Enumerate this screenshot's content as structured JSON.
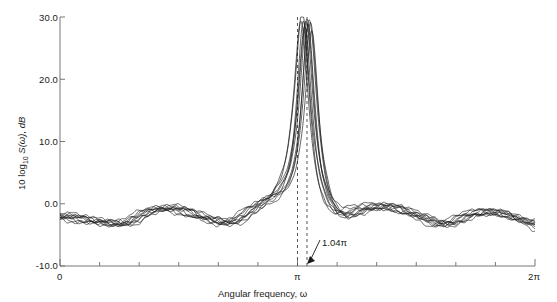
{
  "chart_data": {
    "type": "line",
    "title": "",
    "subtitle": "",
    "xlabel": "Angular frequency, ω",
    "ylabel": "10 log₁₀ S(ω), dB",
    "xlim": [
      0,
      6.283185307
    ],
    "ylim": [
      -10.0,
      30.0
    ],
    "grid": false,
    "legend": null,
    "x_tick_labels": [
      "0",
      "π",
      "2π"
    ],
    "x_tick_values": [
      0,
      3.14159265,
      6.28318531
    ],
    "x_minor_tick_count": 12,
    "y_tick_labels": [
      "30.0",
      "20.0",
      "10.0",
      "0.0",
      "-10.0"
    ],
    "y_tick_values": [
      30.0,
      20.0,
      10.0,
      0.0,
      -10.0
    ],
    "annotations": [
      {
        "text": "1.04π",
        "x": 3.26725,
        "y": -10.0,
        "kind": "arrow-label",
        "target_x": 3.26725,
        "target_y": -10.0
      }
    ],
    "reference_lines": [
      {
        "name": "pi-marker",
        "x": 3.14159265,
        "style": "dashed",
        "color": "#555555"
      },
      {
        "name": "peak-marker-1.04pi",
        "x": 3.26725,
        "style": "dashed",
        "color": "#555555"
      }
    ],
    "series_count": 10,
    "series_description": "Ten overlapping spectral-estimate realizations of 10 log10 S(omega); sharp narrowband peak reaching ~30 dB just right of omega = pi (at 1.04 pi), with low-level rippled sidelobe floor near -2 dB elsewhere, roughly symmetric about pi.",
    "series": [
      {
        "name": "realization-1",
        "peak_db": 30.0,
        "peak_x": 3.2673,
        "floor_mean_db": -2.0
      },
      {
        "name": "realization-2",
        "peak_db": 29.6,
        "peak_x": 3.2516,
        "floor_mean_db": -2.1
      },
      {
        "name": "realization-3",
        "peak_db": 29.2,
        "peak_x": 3.283,
        "floor_mean_db": -1.9
      },
      {
        "name": "realization-4",
        "peak_db": 28.8,
        "peak_x": 3.2359,
        "floor_mean_db": -2.2
      },
      {
        "name": "realization-5",
        "peak_db": 30.0,
        "peak_x": 3.2987,
        "floor_mean_db": -1.8
      },
      {
        "name": "realization-6",
        "peak_db": 29.4,
        "peak_x": 3.2202,
        "floor_mean_db": -2.3
      },
      {
        "name": "realization-7",
        "peak_db": 28.4,
        "peak_x": 3.3144,
        "floor_mean_db": -2.0
      },
      {
        "name": "realization-8",
        "peak_db": 29.8,
        "peak_x": 3.2045,
        "floor_mean_db": -2.1
      },
      {
        "name": "realization-9",
        "peak_db": 27.9,
        "peak_x": 3.3301,
        "floor_mean_db": -1.7
      },
      {
        "name": "realization-10",
        "peak_db": 29.1,
        "peak_x": 3.1888,
        "floor_mean_db": -2.4
      }
    ],
    "floor_ripple": {
      "mean_db": -2.0,
      "amplitude_db": 1.4,
      "lobe_count_per_side": 3,
      "edge_value_db": -3.0
    },
    "line_color": "#1a1a1a",
    "axis_color": "#777777"
  },
  "axis": {
    "y_labels": [
      "30.0",
      "20.0",
      "10.0",
      "0.0",
      "-10.0"
    ],
    "x_labels": [
      "0",
      "π",
      "2π"
    ],
    "x_title": "Angular frequency, ω",
    "y_title_prefix": "10 log",
    "y_title_sub": "10",
    "y_title_suffix": " S(ω), dB"
  },
  "annotation": {
    "peak_label": "1.04π"
  }
}
